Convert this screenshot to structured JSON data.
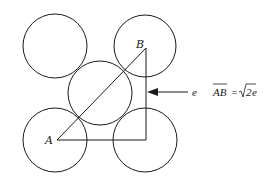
{
  "diagram": {
    "type": "geometry-packing",
    "colors": {
      "stroke": "#1a1a1a",
      "background": "#ffffff"
    },
    "circles": [
      {
        "id": "top-left",
        "cx": 55,
        "cy": 46,
        "r": 32
      },
      {
        "id": "top-right",
        "cx": 145,
        "cy": 46,
        "r": 31
      },
      {
        "id": "center",
        "cx": 100,
        "cy": 93,
        "r": 32
      },
      {
        "id": "bottom-left",
        "cx": 55,
        "cy": 140,
        "r": 32
      },
      {
        "id": "bottom-right",
        "cx": 145,
        "cy": 140,
        "r": 32
      }
    ],
    "points": {
      "A": {
        "label": "A",
        "x": 57,
        "y": 140
      },
      "B": {
        "label": "B",
        "x": 146,
        "y": 48
      }
    },
    "edge_label": "e",
    "formula": {
      "lhs": "AB",
      "equals": "=",
      "sqrt_arg": "2",
      "suffix": "e"
    }
  }
}
